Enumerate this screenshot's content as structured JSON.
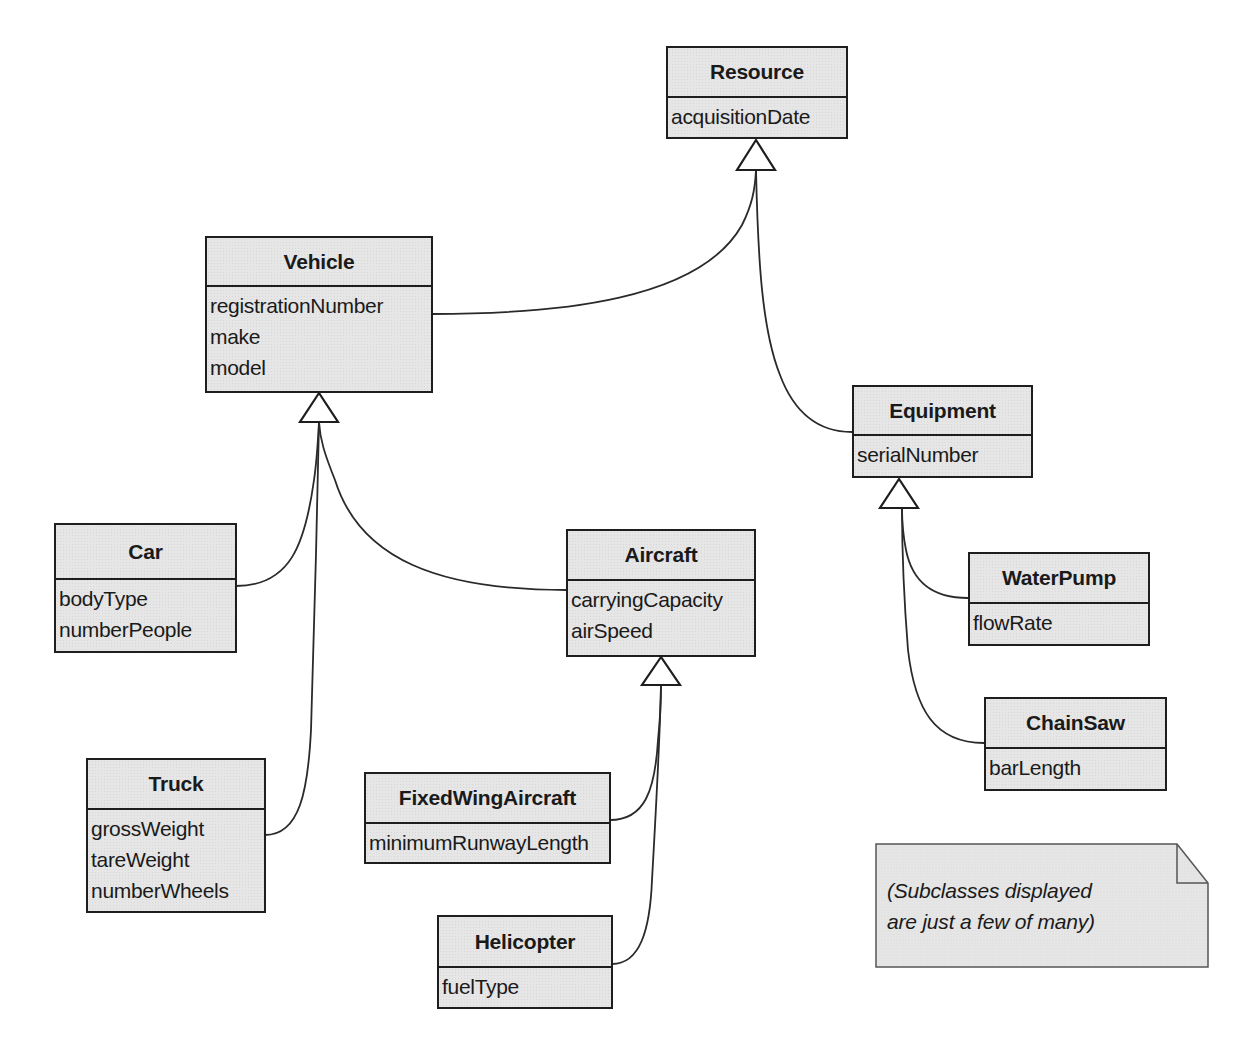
{
  "diagram": {
    "type": "UML class diagram (generalization hierarchy)",
    "classes": {
      "resource": {
        "name": "Resource",
        "attributes": [
          "acquisitionDate"
        ]
      },
      "vehicle": {
        "name": "Vehicle",
        "attributes": [
          "registrationNumber",
          "make",
          "model"
        ]
      },
      "equipment": {
        "name": "Equipment",
        "attributes": [
          "serialNumber"
        ]
      },
      "car": {
        "name": "Car",
        "attributes": [
          "bodyType",
          "numberPeople"
        ]
      },
      "aircraft": {
        "name": "Aircraft",
        "attributes": [
          "carryingCapacity",
          "airSpeed"
        ]
      },
      "truck": {
        "name": "Truck",
        "attributes": [
          "grossWeight",
          "tareWeight",
          "numberWheels"
        ]
      },
      "fixedwing": {
        "name": "FixedWingAircraft",
        "attributes": [
          "minimumRunwayLength"
        ]
      },
      "helicopter": {
        "name": "Helicopter",
        "attributes": [
          "fuelType"
        ]
      },
      "waterpump": {
        "name": "WaterPump",
        "attributes": [
          "flowRate"
        ]
      },
      "chainsaw": {
        "name": "ChainSaw",
        "attributes": [
          "barLength"
        ]
      }
    },
    "generalizations": [
      {
        "child": "Vehicle",
        "parent": "Resource"
      },
      {
        "child": "Equipment",
        "parent": "Resource"
      },
      {
        "child": "Car",
        "parent": "Vehicle"
      },
      {
        "child": "Truck",
        "parent": "Vehicle"
      },
      {
        "child": "Aircraft",
        "parent": "Vehicle"
      },
      {
        "child": "FixedWingAircraft",
        "parent": "Aircraft"
      },
      {
        "child": "Helicopter",
        "parent": "Aircraft"
      },
      {
        "child": "WaterPump",
        "parent": "Equipment"
      },
      {
        "child": "ChainSaw",
        "parent": "Equipment"
      }
    ],
    "note": {
      "text": "(Subclasses displayed\nare just a few of many)"
    },
    "colors": {
      "box_fill": "#e6e6e6",
      "stroke": "#1e1e1e",
      "background": "#ffffff"
    }
  }
}
